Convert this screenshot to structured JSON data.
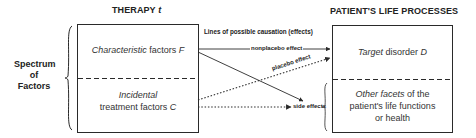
{
  "diagram": {
    "left_title": "THERAPY",
    "left_title_var": "t",
    "right_title": "PATIENT'S LIFE PROCESSES",
    "side_label": [
      "Spectrum",
      "of",
      "Factors"
    ],
    "header_label": "Lines of possible causation (effects)",
    "left_box": {
      "top": {
        "italic": "Characteristic",
        "text": "factors",
        "var": "F"
      },
      "bottom": {
        "italic": "Incidental",
        "text": "treatment factors",
        "var": "C"
      }
    },
    "right_box": {
      "top": {
        "italic": "Target",
        "text": "disorder",
        "var": "D"
      },
      "bottom": {
        "italic": "Other facets",
        "text": "of the",
        "line2": "patient's life functions",
        "line3": "or health"
      }
    },
    "arrows": [
      {
        "label": "nonplacebo effect",
        "style": "solid",
        "from": "Characteristic factors F",
        "to": "Target disorder D"
      },
      {
        "label": "placebo effect",
        "style": "dotted",
        "from": "Incidental treatment factors C",
        "to": "Target disorder D"
      },
      {
        "label": "",
        "style": "solid",
        "from": "Characteristic factors F",
        "to": "side effects"
      },
      {
        "label": "side effects",
        "style": "dotted",
        "from": "Incidental treatment factors C",
        "to": "Other facets of the patient's life functions or health"
      }
    ],
    "colors": {
      "line": "#2a2a2a",
      "background": "#ffffff"
    }
  }
}
